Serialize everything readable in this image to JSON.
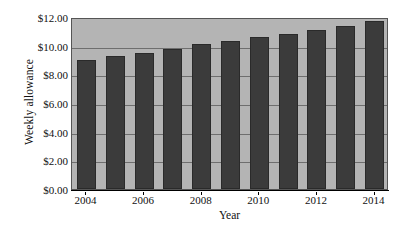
{
  "chart_data": {
    "type": "bar",
    "title": "",
    "xlabel": "Year",
    "ylabel": "Weekly allowance",
    "categories": [
      "2004",
      "2005",
      "2006",
      "2007",
      "2008",
      "2009",
      "2010",
      "2011",
      "2012",
      "2013",
      "2014"
    ],
    "values": [
      9.0,
      9.25,
      9.5,
      9.8,
      10.1,
      10.3,
      10.6,
      10.8,
      11.1,
      11.35,
      11.7
    ],
    "x_tick_labels": [
      "2004",
      "2006",
      "2008",
      "2010",
      "2012",
      "2014"
    ],
    "x_tick_categories": [
      "2004",
      "2006",
      "2008",
      "2010",
      "2012",
      "2014"
    ],
    "y_tick_labels": [
      "$0.00",
      "$2.00",
      "$4.00",
      "$6.00",
      "$8.00",
      "$10.00",
      "$12.00"
    ],
    "y_tick_values": [
      0,
      2,
      4,
      6,
      8,
      10,
      12
    ],
    "ylim": [
      0,
      12
    ],
    "grid": true,
    "legend": "none",
    "colors": {
      "bar_fill": "#3b3b3b",
      "bar_edge": "#2a2a2a",
      "plot_background": "#b4b4b4",
      "gridline": "#6e6e6e",
      "axis": "#000000",
      "figure_background": "#ffffff",
      "text": "#111111"
    }
  }
}
